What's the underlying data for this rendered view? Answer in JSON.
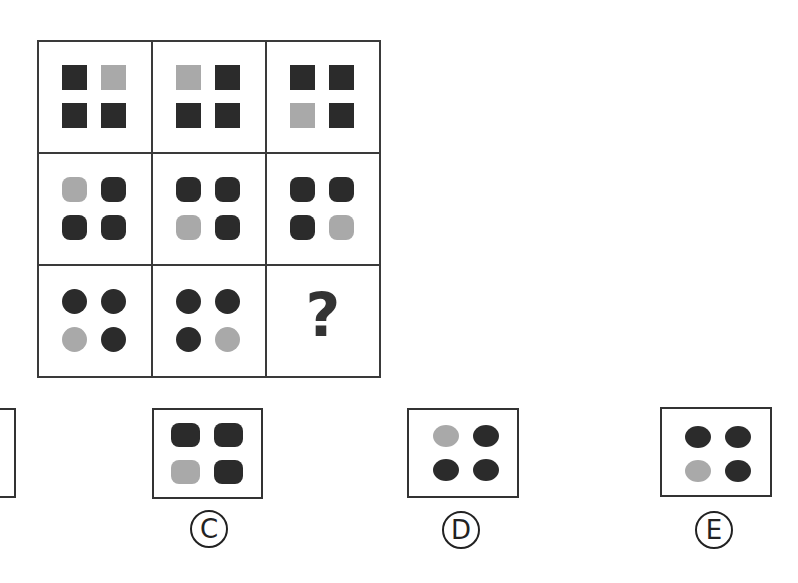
{
  "puzzle": {
    "colors": {
      "dark": "#2b2b2b",
      "light": "#a9a9a9",
      "grid_line": "#3a3a3a"
    },
    "grid": {
      "rows": [
        [
          {
            "shape": "square",
            "pattern": [
              "dark",
              "light",
              "dark",
              "dark"
            ]
          },
          {
            "shape": "square",
            "pattern": [
              "light",
              "dark",
              "dark",
              "dark"
            ]
          },
          {
            "shape": "square",
            "pattern": [
              "dark",
              "dark",
              "light",
              "dark"
            ]
          }
        ],
        [
          {
            "shape": "rounded-square",
            "pattern": [
              "light",
              "dark",
              "dark",
              "dark"
            ]
          },
          {
            "shape": "rounded-square",
            "pattern": [
              "dark",
              "dark",
              "light",
              "dark"
            ]
          },
          {
            "shape": "rounded-square",
            "pattern": [
              "dark",
              "dark",
              "dark",
              "light"
            ]
          }
        ],
        [
          {
            "shape": "circle",
            "pattern": [
              "dark",
              "dark",
              "light",
              "dark"
            ]
          },
          {
            "shape": "circle",
            "pattern": [
              "dark",
              "dark",
              "dark",
              "light"
            ]
          },
          {
            "shape": "missing",
            "symbol": "?"
          }
        ]
      ]
    },
    "options": [
      {
        "label": "B",
        "glyph": "Ⓑ",
        "partial": true
      },
      {
        "label": "C",
        "glyph": "Ⓒ",
        "shape": "rounded-square",
        "pattern": [
          "dark",
          "dark",
          "light",
          "dark"
        ]
      },
      {
        "label": "D",
        "glyph": "Ⓓ",
        "shape": "ellipse",
        "pattern": [
          "light",
          "dark",
          "dark",
          "dark"
        ]
      },
      {
        "label": "E",
        "glyph": "Ⓔ",
        "shape": "ellipse",
        "pattern": [
          "dark",
          "dark",
          "light",
          "dark"
        ]
      }
    ],
    "missing_symbol": "?",
    "label_c": "C",
    "label_d": "D",
    "label_e": "E"
  }
}
